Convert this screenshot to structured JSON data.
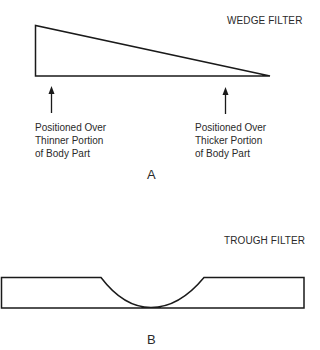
{
  "panels": {
    "a": {
      "title": "WEDGE FILTER",
      "letter": "A",
      "labels": {
        "left": [
          "Positioned Over",
          "Thinner Portion",
          "of Body Part"
        ],
        "right": [
          "Positioned Over",
          "Thicker Portion",
          "of Body Part"
        ]
      }
    },
    "b": {
      "title": "TROUGH FILTER",
      "letter": "B"
    }
  },
  "colors": {
    "stroke": "#1a1a1a",
    "background": "#ffffff"
  }
}
